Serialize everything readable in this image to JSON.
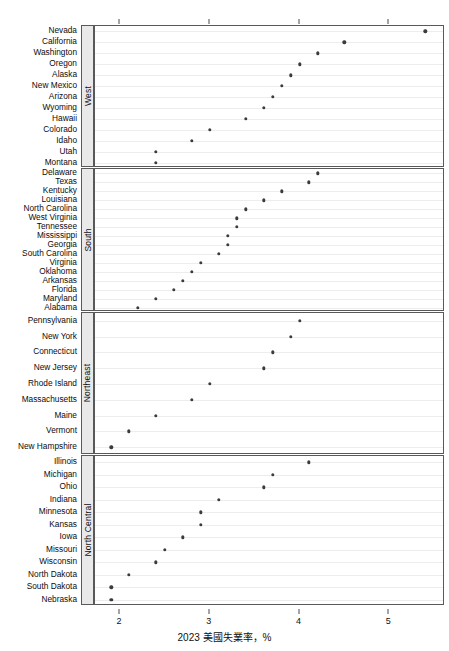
{
  "chart_data": {
    "type": "scatter",
    "title": "",
    "xlabel": "2023 美國失業率，%",
    "ylabel": "",
    "xlim": [
      1.72,
      5.62
    ],
    "xticks": [
      2,
      3,
      4,
      5
    ],
    "xticklabels": [
      "2",
      "3",
      "4",
      "5"
    ],
    "grid": true,
    "legend": null,
    "dot_color": "#3b3b3b",
    "strip_color": "#e9e9e9",
    "panel_border_color": "#595959",
    "orientation": "horizontal-dotplot",
    "panels": [
      {
        "label": "West",
        "categories": [
          "Nevada",
          "California",
          "Washington",
          "Oregon",
          "Alaska",
          "New Mexico",
          "Arizona",
          "Wyoming",
          "Hawaii",
          "Colorado",
          "Idaho",
          "Utah",
          "Montana"
        ],
        "values": [
          5.4,
          4.5,
          4.2,
          4.0,
          3.9,
          3.8,
          3.7,
          3.6,
          3.4,
          3.0,
          2.8,
          2.4,
          2.4
        ]
      },
      {
        "label": "South",
        "categories": [
          "Delaware",
          "Texas",
          "Kentucky",
          "Louisiana",
          "North Carolina",
          "West Virginia",
          "Tennessee",
          "Mississippi",
          "Georgia",
          "South Carolina",
          "Virginia",
          "Oklahoma",
          "Arkansas",
          "Florida",
          "Maryland",
          "Alabama"
        ],
        "values": [
          4.2,
          4.1,
          3.8,
          3.6,
          3.4,
          3.3,
          3.3,
          3.2,
          3.2,
          3.1,
          2.9,
          2.8,
          2.7,
          2.6,
          2.4,
          2.2
        ]
      },
      {
        "label": "Northeast",
        "categories": [
          "Pennsylvania",
          "New York",
          "Connecticut",
          "New Jersey",
          "Rhode Island",
          "Massachusetts",
          "Maine",
          "Vermont",
          "New Hampshire"
        ],
        "values": [
          4.0,
          3.9,
          3.7,
          3.6,
          3.0,
          2.8,
          2.4,
          2.1,
          1.9
        ]
      },
      {
        "label": "North Central",
        "categories": [
          "Illinois",
          "Michigan",
          "Ohio",
          "Indiana",
          "Minnesota",
          "Kansas",
          "Iowa",
          "Missouri",
          "Wisconsin",
          "North Dakota",
          "South Dakota",
          "Nebraska"
        ],
        "values": [
          4.1,
          3.7,
          3.6,
          3.1,
          2.9,
          2.9,
          2.7,
          2.5,
          2.4,
          2.1,
          1.9,
          1.9
        ]
      }
    ]
  }
}
